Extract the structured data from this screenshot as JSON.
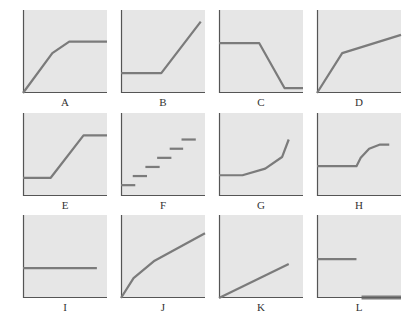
{
  "colors": {
    "background": "#ffffff",
    "panel_fill": "#e6e6e6",
    "axis": "#555555",
    "curve": "#7b7b7b",
    "label": "#333333"
  },
  "chart_data": [
    {
      "label": "A",
      "type": "line",
      "description": "Linear rise from origin, curving to a plateau",
      "points": [
        [
          0,
          0
        ],
        [
          35,
          48
        ],
        [
          55,
          62
        ],
        [
          100,
          62
        ]
      ]
    },
    {
      "label": "B",
      "type": "line",
      "description": "Flat then linear rise",
      "points": [
        [
          0,
          24
        ],
        [
          48,
          24
        ],
        [
          95,
          86
        ]
      ]
    },
    {
      "label": "C",
      "type": "line",
      "description": "Flat high, steep decline, flat low",
      "points": [
        [
          0,
          60
        ],
        [
          48,
          60
        ],
        [
          78,
          6
        ],
        [
          100,
          6
        ]
      ]
    },
    {
      "label": "D",
      "type": "line",
      "description": "Steep rise then shallower linear rise",
      "points": [
        [
          0,
          0
        ],
        [
          30,
          48
        ],
        [
          100,
          70
        ]
      ]
    },
    {
      "label": "E",
      "type": "line",
      "description": "Flat low, linear rise, flat high",
      "points": [
        [
          0,
          22
        ],
        [
          33,
          22
        ],
        [
          72,
          73
        ],
        [
          100,
          73
        ]
      ]
    },
    {
      "label": "F",
      "type": "step",
      "description": "Discrete staircase of six steps",
      "segments": [
        [
          [
            0,
            13
          ],
          [
            17,
            13
          ]
        ],
        [
          [
            14,
            24
          ],
          [
            31,
            24
          ]
        ],
        [
          [
            29,
            35
          ],
          [
            46,
            35
          ]
        ],
        [
          [
            43,
            46
          ],
          [
            60,
            46
          ]
        ],
        [
          [
            58,
            57
          ],
          [
            74,
            57
          ]
        ],
        [
          [
            72,
            68
          ],
          [
            89,
            68
          ]
        ]
      ]
    },
    {
      "label": "G",
      "type": "line",
      "description": "Flat then accelerating (convex) rise",
      "points": [
        [
          0,
          25
        ],
        [
          28,
          25
        ],
        [
          55,
          33
        ],
        [
          75,
          47
        ],
        [
          83,
          68
        ]
      ]
    },
    {
      "label": "H",
      "type": "line",
      "description": "Flat then concave rise leveling off",
      "points": [
        [
          0,
          36
        ],
        [
          47,
          36
        ],
        [
          52,
          46
        ],
        [
          62,
          57
        ],
        [
          75,
          62
        ],
        [
          86,
          62
        ]
      ]
    },
    {
      "label": "I",
      "type": "line",
      "description": "Horizontal constant line",
      "points": [
        [
          0,
          36
        ],
        [
          88,
          36
        ]
      ]
    },
    {
      "label": "J",
      "type": "line",
      "description": "Concave increasing curve from origin",
      "points": [
        [
          0,
          0
        ],
        [
          15,
          24
        ],
        [
          40,
          45
        ],
        [
          100,
          78
        ]
      ]
    },
    {
      "label": "K",
      "type": "line",
      "description": "Straight line from origin with moderate slope",
      "points": [
        [
          0,
          0
        ],
        [
          83,
          41
        ]
      ]
    },
    {
      "label": "L",
      "type": "step",
      "description": "Constant level then drop to zero",
      "segments": [
        [
          [
            0,
            47
          ],
          [
            47,
            47
          ]
        ]
      ],
      "segments_low": [
        [
          [
            53,
            2
          ],
          [
            100,
            2
          ]
        ],
        [
          [
            53,
            -1
          ],
          [
            100,
            -1
          ]
        ]
      ]
    }
  ],
  "labels": [
    "A",
    "B",
    "C",
    "D",
    "E",
    "F",
    "G",
    "H",
    "I",
    "J",
    "K",
    "L"
  ]
}
